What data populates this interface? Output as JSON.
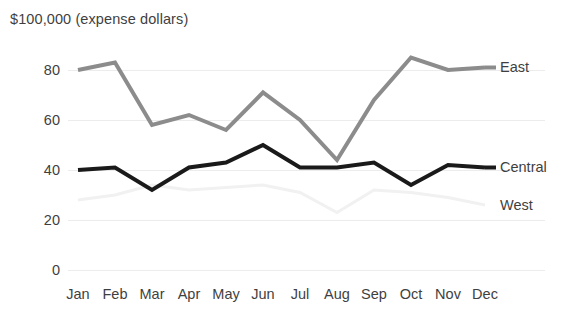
{
  "chart_data": {
    "type": "line",
    "title": "$100,000 (expense dollars)",
    "xlabel": "",
    "ylabel": "",
    "categories": [
      "Jan",
      "Feb",
      "Mar",
      "Apr",
      "May",
      "Jun",
      "Jul",
      "Aug",
      "Sep",
      "Oct",
      "Nov",
      "Dec"
    ],
    "ylim": [
      0,
      90
    ],
    "yticks": [
      0,
      20,
      40,
      60,
      80
    ],
    "grid": true,
    "legend_position": "right-inline-labels",
    "series": [
      {
        "name": "East",
        "color": "#8c8c8c",
        "width": 4,
        "label_value": 81,
        "values": [
          80,
          83,
          58,
          62,
          56,
          71,
          60,
          44,
          68,
          85,
          80,
          81
        ]
      },
      {
        "name": "Central",
        "color": "#1a1a1a",
        "width": 4,
        "label_value": 41,
        "values": [
          40,
          41,
          32,
          41,
          43,
          50,
          41,
          41,
          43,
          34,
          42,
          41
        ]
      },
      {
        "name": "West",
        "color": "#f1f1f1",
        "width": 3,
        "label_value": 26,
        "values": [
          28,
          30,
          34,
          32,
          33,
          34,
          31,
          23,
          32,
          31,
          29,
          26
        ]
      }
    ]
  },
  "axis": {
    "ytick_labels": [
      "0",
      "20",
      "40",
      "60",
      "80"
    ],
    "xtick_labels": [
      "Jan",
      "Feb",
      "Mar",
      "Apr",
      "May",
      "Jun",
      "Jul",
      "Aug",
      "Sep",
      "Oct",
      "Nov",
      "Dec"
    ]
  },
  "legend": {
    "items": [
      "East",
      "Central",
      "West"
    ]
  }
}
